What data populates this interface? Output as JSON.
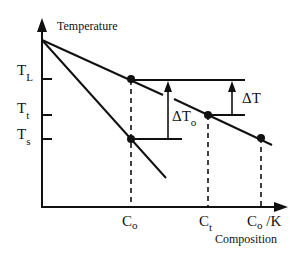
{
  "diagram": {
    "y_axis_label": "Temperature",
    "x_axis_label": "Composition",
    "y_ticks": [
      {
        "main": "T",
        "sub": "L",
        "y": 79
      },
      {
        "main": "T",
        "sub": "t",
        "y": 115
      },
      {
        "main": "T",
        "sub": "s",
        "y": 139
      }
    ],
    "x_ticks": [
      {
        "main": "C",
        "sub": "o",
        "suffix": ""
      },
      {
        "main": "C",
        "sub": "t",
        "suffix": ""
      },
      {
        "main": "C",
        "sub": "o",
        "suffix": " /K"
      }
    ],
    "annotations": {
      "delta_t0": {
        "main": "ΔT",
        "sub": "o"
      },
      "delta_t": "ΔT"
    },
    "lines": {
      "liquidus": "upper sloping line",
      "solidus": "steeper lower line"
    },
    "colors": {
      "ink": "#111111",
      "background": "#ffffff"
    }
  }
}
